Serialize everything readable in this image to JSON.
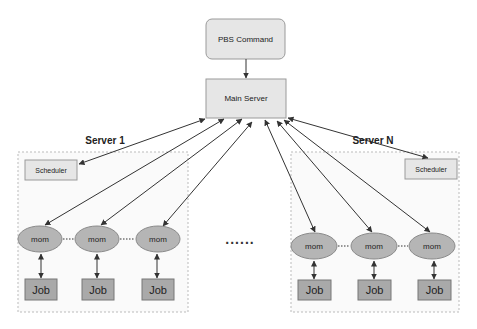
{
  "diagram": {
    "type": "architecture",
    "colors": {
      "box_fill": "#e6e6e6",
      "box_stroke": "#9a9a9a",
      "mom_fill": "#b5b5b5",
      "job_fill": "#a9a9a9",
      "edge": "#333333",
      "cluster_stroke": "#bbbbbb",
      "cluster_fill": "#fafafa"
    },
    "nodes": {
      "pbs_command": "PBS Command",
      "main_server": "Main Server"
    },
    "clusters": [
      {
        "label": "Server 1",
        "scheduler": "Scheduler",
        "moms": [
          "mom",
          "mom",
          "mom"
        ],
        "jobs": [
          "Job",
          "Job",
          "Job"
        ],
        "separators": [
          "....",
          "......."
        ]
      },
      {
        "label": "Server N",
        "scheduler": "Scheduler",
        "moms": [
          "mom",
          "mom",
          "mom"
        ],
        "jobs": [
          "Job",
          "Job",
          "Job"
        ],
        "separators": [
          "....",
          "...."
        ]
      }
    ],
    "between_clusters": "......",
    "edges": [
      {
        "from": "PBS Command",
        "to": "Main Server",
        "direction": "forward"
      },
      {
        "from": "Main Server",
        "to": "Server 1 Scheduler",
        "direction": "both"
      },
      {
        "from": "Main Server",
        "to": "Server 1 mom 1",
        "direction": "both"
      },
      {
        "from": "Main Server",
        "to": "Server 1 mom 2",
        "direction": "both"
      },
      {
        "from": "Main Server",
        "to": "Server 1 mom 3",
        "direction": "both"
      },
      {
        "from": "Main Server",
        "to": "Server N mom 1",
        "direction": "both"
      },
      {
        "from": "Main Server",
        "to": "Server N mom 2",
        "direction": "both"
      },
      {
        "from": "Main Server",
        "to": "Server N mom 3",
        "direction": "both"
      },
      {
        "from": "Main Server",
        "to": "Server N Scheduler",
        "direction": "both"
      },
      {
        "from": "mom",
        "to": "Job",
        "direction": "both"
      }
    ]
  }
}
